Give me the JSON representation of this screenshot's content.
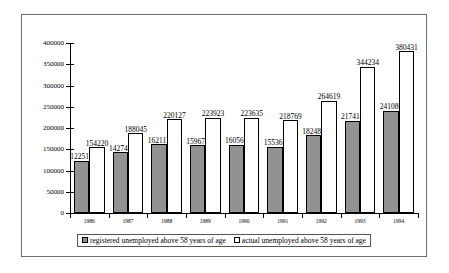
{
  "chart_data": {
    "type": "bar",
    "title": "",
    "subtitle": "",
    "xlabel": "",
    "ylabel": "",
    "categories": [
      "1986",
      "1987",
      "1988",
      "1989",
      "1990",
      "1991",
      "1992",
      "1993",
      "1994"
    ],
    "series": [
      {
        "name": "registered unemployed above 58 years of age",
        "values": [
          122510,
          142744,
          162117,
          159672,
          160561,
          155361,
          182480,
          217414,
          241080
        ],
        "fill": "dark-hatched",
        "color": "#4a4a4a"
      },
      {
        "name": "actual unemployed above 58 years of age",
        "values": [
          154220,
          188045,
          220127,
          223923,
          223635,
          218769,
          264619,
          344234,
          380431
        ],
        "fill": "white",
        "color": "#ffffff"
      }
    ],
    "ylim": [
      0,
      400000
    ],
    "ytick_values": [
      0,
      50000,
      100000,
      150000,
      200000,
      250000,
      300000,
      350000,
      400000
    ],
    "ytick_labels": [
      "0",
      "50000",
      "100000",
      "150000",
      "200000",
      "250000",
      "300000",
      "350000",
      "400000"
    ],
    "grid": false,
    "data_labels": true,
    "legend_position": "bottom",
    "legend": [
      "registered unemployed above 58 years of age",
      "actual unemployed above 58 years of age"
    ]
  }
}
